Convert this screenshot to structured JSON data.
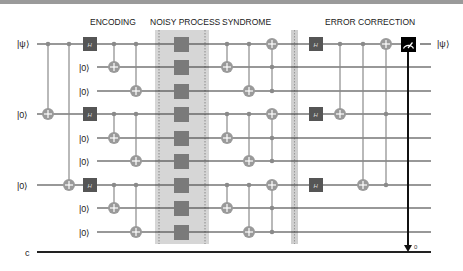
{
  "diagram": {
    "type": "quantum-circuit",
    "sections": [
      {
        "id": "encoding",
        "label": "ENCODING"
      },
      {
        "id": "noisy",
        "label": "NOISY PROCESS"
      },
      {
        "id": "syndrome",
        "label": "SYNDROME"
      },
      {
        "id": "correction",
        "label": "ERROR CORRECTION"
      }
    ],
    "inputs": [
      {
        "wire": 0,
        "label": "|ψ⟩"
      },
      {
        "wire": 1,
        "label": "|0⟩"
      },
      {
        "wire": 2,
        "label": "|0⟩"
      },
      {
        "wire": 3,
        "label": "|0⟩"
      },
      {
        "wire": 4,
        "label": "|0⟩"
      },
      {
        "wire": 5,
        "label": "|0⟩"
      },
      {
        "wire": 6,
        "label": "|0⟩"
      },
      {
        "wire": 7,
        "label": "|0⟩"
      },
      {
        "wire": 8,
        "label": "|0⟩"
      }
    ],
    "output_label": "|ψ⟩",
    "classical_label": "c",
    "measure_bit_label": "0",
    "colors": {
      "wire": "#333333",
      "gate": "#555555",
      "control": "#8a8a8a",
      "noisy_bg": "#d4d4d4",
      "measure": "#000000"
    }
  }
}
